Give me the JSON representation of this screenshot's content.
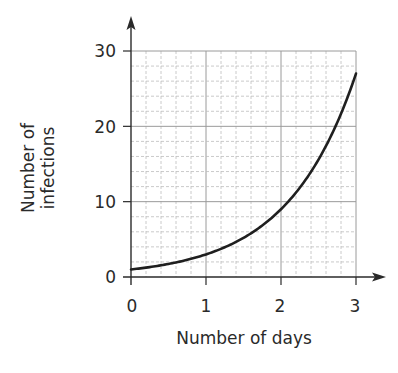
{
  "chart_data": {
    "type": "line",
    "title": "",
    "xlabel": "Number of days",
    "ylabel": "Number of infections",
    "ylabel_lines": [
      "Number of",
      "infections"
    ],
    "xlim": [
      0,
      3
    ],
    "ylim": [
      0,
      30
    ],
    "x_ticks": [
      "0",
      "1",
      "2",
      "3"
    ],
    "y_ticks": [
      "0",
      "10",
      "20",
      "30"
    ],
    "grid": true,
    "grid_minor_divisions": 5,
    "legend": null,
    "series": [
      {
        "name": "Number of infections",
        "function": "y = 3^x",
        "x": [
          0,
          0.5,
          1,
          1.5,
          2,
          2.5,
          3
        ],
        "y": [
          1,
          1.7,
          3,
          5.2,
          9,
          15.6,
          27
        ]
      }
    ]
  },
  "labels": {
    "x_title": "Number of days",
    "y_title_line1": "Number of",
    "y_title_line2": "infections",
    "x0": "0",
    "x1": "1",
    "x2": "2",
    "x3": "3",
    "y0": "0",
    "y10": "10",
    "y20": "20",
    "y30": "30"
  },
  "colors": {
    "curve": "#1f1f1f",
    "axis": "#2a2a2a",
    "grid_major": "#9a9a9a",
    "grid_minor": "#bdbdbd"
  }
}
